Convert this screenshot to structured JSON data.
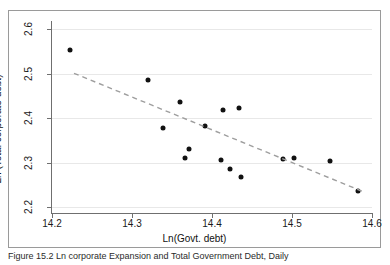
{
  "figure": {
    "caption": "Figure 15.2  Ln corporate Expansion and Total Government Debt, Daily",
    "background_color": "#ffffff",
    "frame_color": "#9a9a9a"
  },
  "chart_data": {
    "type": "scatter",
    "title": "",
    "xlabel": "Ln(Govt. debt)",
    "ylabel": "Ln (Total corporate debt)",
    "xlim": [
      14.2,
      14.6
    ],
    "ylim": [
      2.2,
      2.6
    ],
    "xticks": [
      14.2,
      14.3,
      14.4,
      14.5,
      14.6
    ],
    "xtick_labels": [
      "14.2",
      "14.3",
      "14.4",
      "14.5",
      "14.6"
    ],
    "yticks": [
      2.2,
      2.3,
      2.4,
      2.5,
      2.6
    ],
    "ytick_labels": [
      "2.2",
      "2.3",
      "2.4",
      "2.5",
      "2.6"
    ],
    "grid": true,
    "grid_axis": "y",
    "grid_color": "#e8e8e8",
    "legend": false,
    "marker_color": "#111111",
    "marker_size": 5,
    "points": [
      {
        "x": 14.222,
        "y": 2.553
      },
      {
        "x": 14.32,
        "y": 2.485
      },
      {
        "x": 14.339,
        "y": 2.377
      },
      {
        "x": 14.36,
        "y": 2.437
      },
      {
        "x": 14.366,
        "y": 2.309
      },
      {
        "x": 14.371,
        "y": 2.331
      },
      {
        "x": 14.391,
        "y": 2.383
      },
      {
        "x": 14.411,
        "y": 2.305
      },
      {
        "x": 14.414,
        "y": 2.419
      },
      {
        "x": 14.423,
        "y": 2.285
      },
      {
        "x": 14.434,
        "y": 2.423
      },
      {
        "x": 14.436,
        "y": 2.267
      },
      {
        "x": 14.489,
        "y": 2.307
      },
      {
        "x": 14.502,
        "y": 2.311
      },
      {
        "x": 14.547,
        "y": 2.304
      },
      {
        "x": 14.583,
        "y": 2.237
      }
    ],
    "trendline": {
      "style": "dashed",
      "color": "#9e9e9e",
      "x_start": 14.2275,
      "y_start": 2.5005,
      "x_end": 14.5875,
      "y_end": 2.2355
    }
  }
}
